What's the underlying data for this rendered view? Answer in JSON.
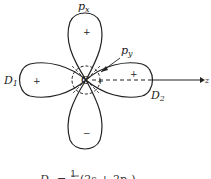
{
  "diagram": {
    "type": "orbital-hybridization",
    "center_label": "C",
    "axis_label": "z",
    "lobes": [
      {
        "id": "px-upper",
        "label": "p_x",
        "sign": "+"
      },
      {
        "id": "px-lower",
        "sign": "−"
      },
      {
        "id": "d1-lobe",
        "label": "D_1",
        "sign": "+"
      },
      {
        "id": "d2-lobe",
        "label": "D_2",
        "sign": "+"
      }
    ],
    "labels": {
      "px": "p",
      "px_sub": "x",
      "py": "p",
      "py_sub": "y",
      "d1": "D",
      "d1_sub": "1",
      "d2": "D",
      "d2_sub": "2",
      "center": "C",
      "z": "z",
      "plus_upper": "+",
      "minus_lower": "−",
      "plus_left": "+",
      "plus_right": "+",
      "small_plus": "+",
      "small_minus_left": "−",
      "small_minus_bottom": "−"
    },
    "formula": {
      "lhs": "D",
      "lhs_sub": "1",
      "eq": "=",
      "num": "1",
      "rhs": "(2s + 2p",
      "rhs_sub": "z",
      "rhs_end": ")"
    }
  }
}
